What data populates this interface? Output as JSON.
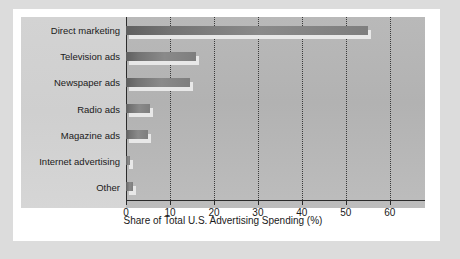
{
  "chart_data": {
    "type": "bar",
    "orientation": "horizontal",
    "title": "",
    "xlabel": "Share of Total U.S. Advertising Spending (%)",
    "ylabel": "",
    "categories": [
      "Direct marketing",
      "Television ads",
      "Newspaper ads",
      "Radio ads",
      "Magazine ads",
      "Internet advertising",
      "Other"
    ],
    "values": [
      55,
      16,
      14.5,
      5.5,
      5,
      1,
      1.5
    ],
    "xlim": [
      0,
      68
    ],
    "xticks": [
      0,
      10,
      20,
      30,
      40,
      50,
      60
    ],
    "xticklabels": [
      "0",
      "10",
      "20",
      "30",
      "40",
      "50",
      "60"
    ],
    "gridlines": [
      10,
      20,
      30,
      40,
      50,
      60
    ],
    "grid": true,
    "grid_style": "dotted",
    "legend": null,
    "bar_color": "#7e7e7e",
    "shadow_color": "#e8e8e8",
    "panel_color": "#b5b5b5",
    "label_panel_color": "#d2d2d2",
    "axis_color": "#2b2b2b",
    "card_color": "#ffffff",
    "outer_color": "#dcdcdc"
  }
}
